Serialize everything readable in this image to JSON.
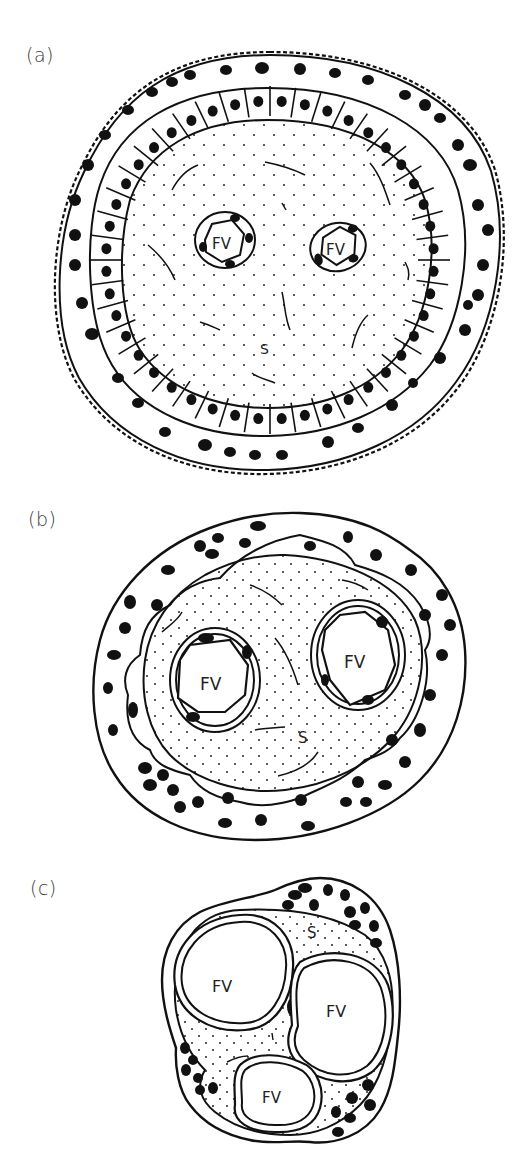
{
  "figure": {
    "panels": [
      {
        "id": "a",
        "label": "(a)",
        "annotations": {
          "fv_left": "FV",
          "fv_right": "FV",
          "stroma": "S"
        }
      },
      {
        "id": "b",
        "label": "(b)",
        "annotations": {
          "fv_left": "FV",
          "fv_right": "FV",
          "stroma": "S"
        }
      },
      {
        "id": "c",
        "label": "(c)",
        "annotations": {
          "fv_top_left": "FV",
          "fv_right": "FV",
          "fv_bottom": "FV",
          "stroma": "S"
        }
      }
    ],
    "colors": {
      "ink": "#111111",
      "background": "#ffffff",
      "label": "#3a3a3a"
    }
  }
}
